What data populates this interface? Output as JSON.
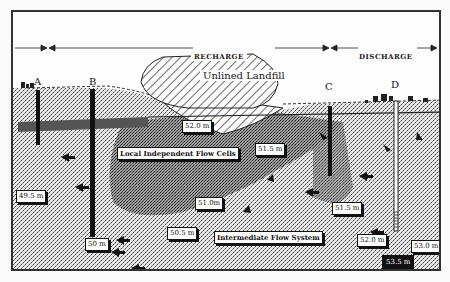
{
  "zones": {
    "recharge": "RECHARGE",
    "discharge": "DISCHARGE"
  },
  "landfill": {
    "label": "Unlined Landfill"
  },
  "wells": [
    {
      "id": "A"
    },
    {
      "id": "B"
    },
    {
      "id": "C"
    },
    {
      "id": "D"
    }
  ],
  "flow_labels": {
    "local": "Local Independent Flow Cells",
    "intermediate": "Intermediate Flow System"
  },
  "head_labels": [
    {
      "id": "h-52-top",
      "text": "52.0 m"
    },
    {
      "id": "h-51-5-upper",
      "text": "51.5 m"
    },
    {
      "id": "h-49-5",
      "text": "49.5 m"
    },
    {
      "id": "h-51-0",
      "text": "51.0m"
    },
    {
      "id": "h-51-5-lower",
      "text": "51.5 m"
    },
    {
      "id": "h-50",
      "text": "50 m"
    },
    {
      "id": "h-50-5",
      "text": "50.5 m"
    },
    {
      "id": "h-52-0-lower",
      "text": "52.0 m"
    },
    {
      "id": "h-53-0",
      "text": "53.0 m"
    },
    {
      "id": "h-dark",
      "text": "53.5 m"
    }
  ],
  "colors": {
    "ink": "#111111",
    "background": "#fdfdfd",
    "sand": "#9a9a9a",
    "plume": "#6a6a6a"
  }
}
